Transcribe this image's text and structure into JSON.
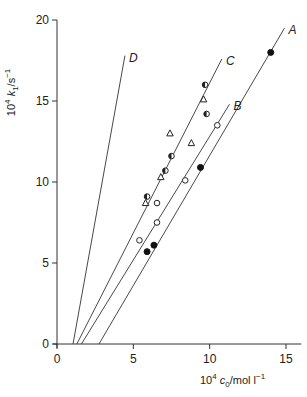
{
  "chart_data": {
    "type": "scatter",
    "title": "",
    "xlabel": "10^4 c0/mol l^-1",
    "ylabel": "10^4 k1/s^-1",
    "xlim": [
      0,
      16
    ],
    "ylim": [
      0,
      20
    ],
    "xticks": [
      0,
      5,
      10,
      15
    ],
    "yticks": [
      0,
      5,
      10,
      15,
      20
    ],
    "grid": false,
    "legend": "none; lines labelled A, B, C, D at their upper ends",
    "series": [
      {
        "name": "filled circles",
        "marker": "filled-circle",
        "line": "A",
        "x": [
          5.9,
          6.35,
          9.4,
          14.0
        ],
        "y": [
          5.7,
          6.1,
          10.9,
          18.0
        ]
      },
      {
        "name": "open circles",
        "marker": "open-circle",
        "line": "B",
        "x": [
          5.4,
          6.55,
          6.55,
          8.4,
          10.5
        ],
        "y": [
          6.4,
          7.5,
          8.7,
          10.1,
          13.5
        ]
      },
      {
        "name": "half-filled circles",
        "marker": "half-circle",
        "line": "C",
        "x": [
          5.9,
          7.1,
          7.5,
          9.8,
          9.7
        ],
        "y": [
          9.1,
          10.7,
          11.6,
          14.2,
          16.0
        ]
      },
      {
        "name": "open triangles",
        "marker": "triangle",
        "line": "C",
        "x": [
          5.8,
          6.8,
          7.4,
          8.8,
          9.6
        ],
        "y": [
          8.7,
          10.3,
          13.0,
          12.4,
          15.1
        ]
      }
    ],
    "lines": [
      {
        "label": "A",
        "x": [
          2.75,
          14.9
        ],
        "y": [
          0,
          19.5
        ]
      },
      {
        "label": "B",
        "x": [
          1.6,
          11.3
        ],
        "y": [
          0,
          14.8
        ]
      },
      {
        "label": "C",
        "x": [
          1.3,
          10.8
        ],
        "y": [
          0,
          17.6
        ]
      },
      {
        "label": "D",
        "x": [
          1.05,
          4.45
        ],
        "y": [
          0,
          17.8
        ]
      }
    ]
  },
  "axis_text": {
    "y_title_main": "10",
    "y_title_sup": "4",
    "y_title_var": "k",
    "y_title_sub": "1",
    "y_title_unit": "/s",
    "y_title_unit_sup": "−1",
    "x_title_main": "10",
    "x_title_sup": "4",
    "x_title_var": "c",
    "x_title_sub": "0",
    "x_title_unit": "/mol l",
    "x_title_unit_sup": "−1"
  }
}
